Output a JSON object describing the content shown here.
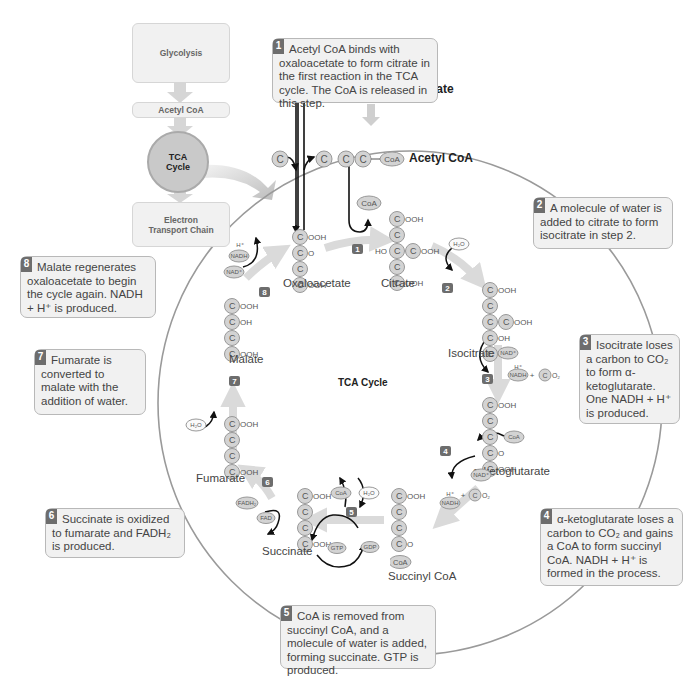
{
  "overview": {
    "glycolysis": "Glycolysis",
    "acetyl_coa": "Acetyl CoA",
    "tca_line1": "TCA",
    "tca_line2": "Cycle",
    "etc_line1": "Electron",
    "etc_line2": "Transport Chain"
  },
  "center_title": "TCA Cycle",
  "inputs": {
    "pyruvate": "Pyruvate",
    "acetyl_coa": "Acetyl CoA"
  },
  "molecules": {
    "oxaloacetate": "Oxaloacetate",
    "citrate": "Citrate",
    "isocitrate": "Isocitrate",
    "alpha_ketoglutarate": "α-ketoglutarate",
    "succinyl_coa": "Succinyl CoA",
    "succinate": "Succinate",
    "fumarate": "Fumarate",
    "malate": "Malate"
  },
  "cofactors": {
    "coa": "CoA",
    "h2o": "H₂O",
    "nad": "NAD⁺",
    "nadh": "NADH",
    "h_plus": "H⁺",
    "co2_c": "C",
    "co2_o": "O₂",
    "gtp": "GTP",
    "gdp": "GDP",
    "fad": "FAD",
    "fadh2": "FADH₂"
  },
  "atoms": {
    "carbon": "C",
    "cooh": "OOH",
    "oh": "OH",
    "o": "O",
    "ho": "HO"
  },
  "steps": [
    {
      "num": "1",
      "text": "Acetyl CoA binds with oxaloacetate to form citrate in the first reaction in the TCA cycle. The CoA is released in this step."
    },
    {
      "num": "2",
      "text": "A molecule of water is added to citrate to form isocitrate in step 2."
    },
    {
      "num": "3",
      "text": "Isocitrate loses a carbon to CO₂ to form α-ketoglutarate. One NADH + H⁺ is produced."
    },
    {
      "num": "4",
      "text": "α-ketoglutarate loses a carbon to CO₂ and gains a CoA to form succinyl CoA. NADH + H⁺ is formed in the process."
    },
    {
      "num": "5",
      "text": "CoA is removed from succinyl CoA, and a molecule of water is added, forming succinate. GTP is produced."
    },
    {
      "num": "6",
      "text": "Succinate is oxidized to fumarate and FADH₂ is produced."
    },
    {
      "num": "7",
      "text": "Fumarate is converted to malate with the addition of water."
    },
    {
      "num": "8",
      "text": "Malate regenerates oxaloacetate to begin the cycle again. NADH + H⁺ is produced."
    }
  ],
  "colors": {
    "callout_bg": "#f1f1f1",
    "callout_border": "#b8b8b8",
    "badge": "#6d6d6d",
    "carbon_fill": "#cfcfcf",
    "cycle_arrow": "#d9d9d9",
    "circle_outline": "#9a9a9a"
  }
}
